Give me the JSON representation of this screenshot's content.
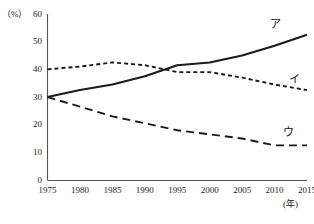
{
  "chart_data": {
    "type": "line",
    "title": "",
    "xlabel": "(年)",
    "ylabel": "(%)",
    "x": [
      1975,
      1980,
      1985,
      1990,
      1995,
      2000,
      2005,
      2010,
      2015
    ],
    "xlim": [
      1975,
      2015
    ],
    "ylim": [
      0,
      60
    ],
    "y_ticks": [
      0,
      10,
      20,
      30,
      40,
      50,
      60
    ],
    "x_ticks": [
      1975,
      1980,
      1985,
      1990,
      1995,
      2000,
      2005,
      2010,
      2015
    ],
    "grid": false,
    "legend_position": "inline-right",
    "series": [
      {
        "name": "ア",
        "style": "solid",
        "color": "#1a1a1a",
        "values": [
          30.0,
          32.5,
          34.5,
          37.5,
          41.5,
          42.5,
          45.0,
          48.5,
          52.5
        ]
      },
      {
        "name": "イ",
        "style": "dotted",
        "color": "#1a1a1a",
        "values": [
          40.0,
          41.0,
          42.5,
          41.5,
          39.0,
          39.0,
          37.0,
          34.5,
          32.5
        ]
      },
      {
        "name": "ウ",
        "style": "dashed",
        "color": "#1a1a1a",
        "values": [
          30.0,
          26.5,
          23.0,
          20.5,
          18.0,
          16.5,
          15.0,
          12.5,
          12.5
        ]
      }
    ],
    "annotations": [
      {
        "text": "ア",
        "x": 2010,
        "y": 56
      },
      {
        "text": "イ",
        "x": 2013,
        "y": 36
      },
      {
        "text": "ウ",
        "x": 2012,
        "y": 17
      }
    ]
  },
  "axes": {
    "unit_y": "（%）",
    "unit_x": "(年)",
    "y_tick_labels": [
      "60",
      "50",
      "40",
      "30",
      "20",
      "10",
      "0"
    ],
    "x_tick_labels": [
      "1975",
      "1980",
      "1985",
      "1990",
      "1995",
      "2000",
      "2005",
      "2010",
      "2015"
    ]
  }
}
